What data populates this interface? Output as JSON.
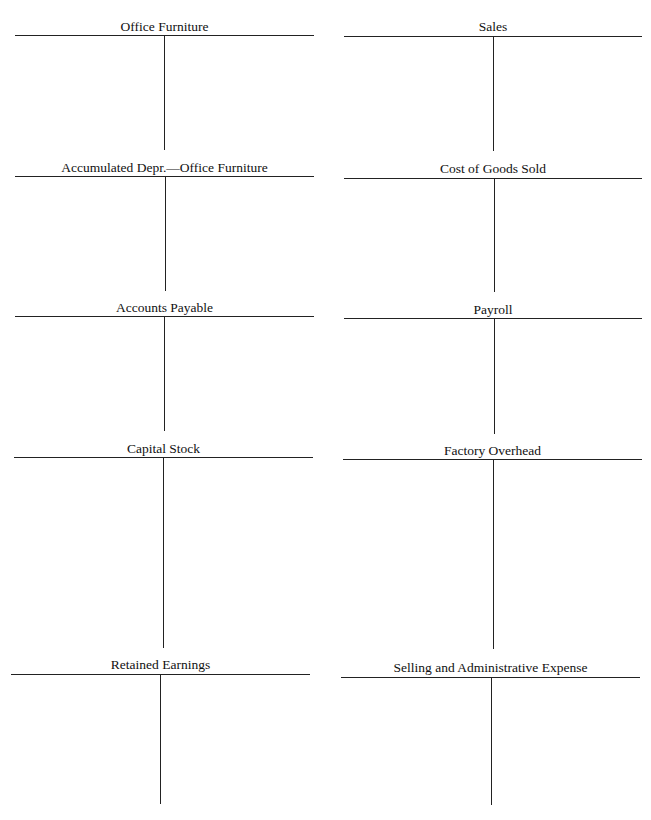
{
  "document": {
    "type": "T-account worksheet",
    "accounts": [
      {
        "title": "Office Furniture",
        "column": "left",
        "row": 1
      },
      {
        "title": "Sales",
        "column": "right",
        "row": 1
      },
      {
        "title": "Accumulated Depr.—Office Furniture",
        "column": "left",
        "row": 2
      },
      {
        "title": "Cost of Goods Sold",
        "column": "right",
        "row": 2
      },
      {
        "title": "Accounts Payable",
        "column": "left",
        "row": 3
      },
      {
        "title": "Payroll",
        "column": "right",
        "row": 3
      },
      {
        "title": "Capital Stock",
        "column": "left",
        "row": 4
      },
      {
        "title": "Factory Overhead",
        "column": "right",
        "row": 4
      },
      {
        "title": "Retained Earnings",
        "column": "left",
        "row": 5
      },
      {
        "title": "Selling and Administrative Expense",
        "column": "right",
        "row": 5
      }
    ]
  }
}
